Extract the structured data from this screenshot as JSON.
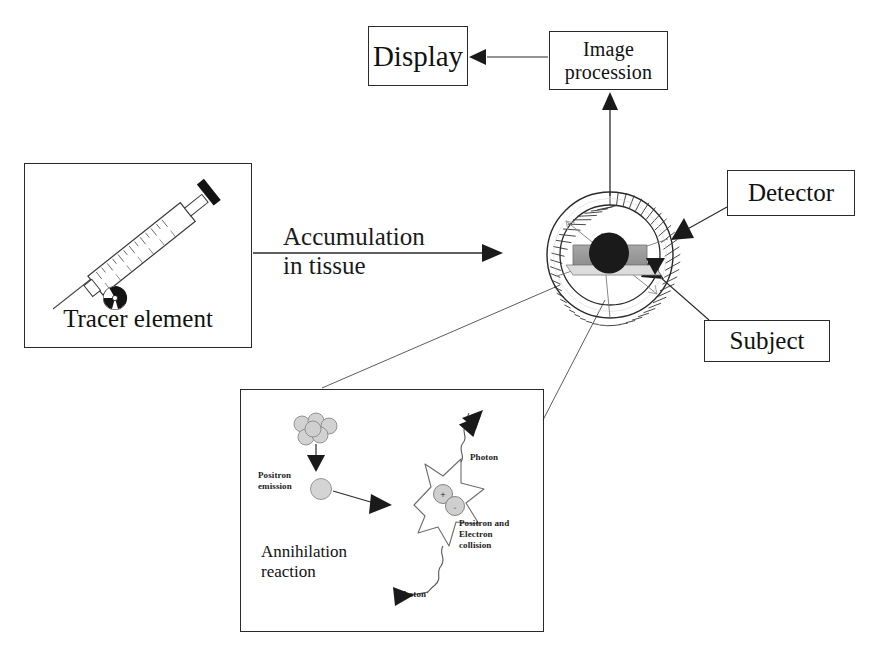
{
  "diagram": {
    "type": "flow-diagram",
    "background": "#ffffff",
    "stroke_color": "#2a2a2a",
    "accent_gray": "#b0b0b0"
  },
  "boxes": {
    "display": {
      "label": "Display"
    },
    "image_procession": {
      "line1": "Image",
      "line2": "procession"
    },
    "detector": {
      "label": "Detector"
    },
    "subject": {
      "label": "Subject"
    },
    "tracer": {
      "caption": "Tracer element"
    },
    "annihilation_panel": {
      "caption": "Annihilation reaction"
    }
  },
  "labels": {
    "accumulation": {
      "line1": "Accumulation",
      "line2": "in tissue"
    },
    "positron_emission": {
      "line1": "Positron",
      "line2": "emission"
    },
    "positron_electron_collision": {
      "line1": "Positron and",
      "line2": "Electron",
      "line3": "collision"
    },
    "photon_top": "Photon",
    "photon_bottom": "Photon",
    "annihilation_reaction": {
      "line1": "Annihilation",
      "line2": "reaction"
    }
  },
  "icons": {
    "syringe": "syringe-icon",
    "radioactive": "radioactive-trefoil-icon",
    "scanner_ring": "pet-scanner-ring-icon",
    "patient_bed": "patient-bed-icon",
    "patient_head": "patient-head-icon",
    "nucleus_cluster": "nucleus-cluster-icon",
    "positron_particle": "positron-particle-icon",
    "annihilation_star": "annihilation-burst-icon",
    "photon_wave_top": "photon-wave-icon",
    "photon_wave_bottom": "photon-wave-icon",
    "arrow_accumulation": "arrow-right-icon",
    "arrow_to_imgproc": "arrow-up-icon",
    "arrow_to_display": "arrow-left-icon",
    "arrow_detector_pointer": "arrow-pointer-icon",
    "arrow_subject_pointer": "arrow-pointer-icon"
  }
}
